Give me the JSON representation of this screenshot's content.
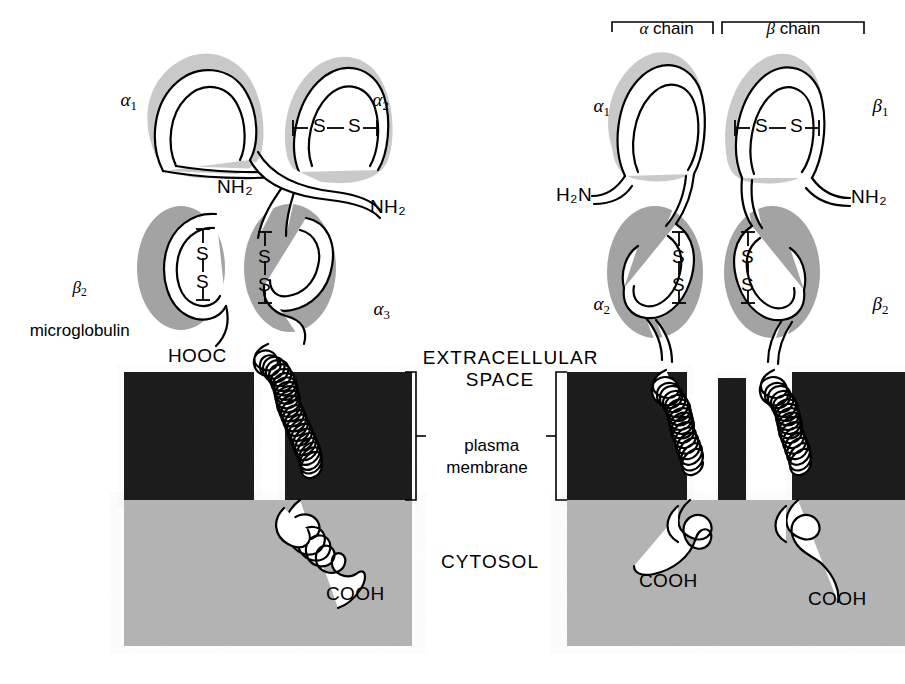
{
  "figure": {
    "colors": {
      "membrane_block": "#1a1a1a",
      "cytosol": "#b3b3b3",
      "domain_light": "#c9c9c9",
      "domain_dark": "#a3a3a3",
      "outline": "#000000",
      "background": "#ffffff"
    }
  },
  "zones": {
    "extracellular": "EXTRACELLULAR\nSPACE",
    "extracellular_line1": "EXTRACELLULAR",
    "extracellular_line2": "SPACE",
    "membrane_line1": "plasma",
    "membrane_line2": "membrane",
    "cytosol": "CYTOSOL"
  },
  "left_panel": {
    "name": "MHC class I molecule",
    "domains": [
      {
        "id": "alpha1",
        "label_greek": "α",
        "label_sub": "1"
      },
      {
        "id": "alpha2",
        "label_greek": "α",
        "label_sub": "2"
      },
      {
        "id": "alpha3",
        "label_greek": "α",
        "label_sub": "3"
      }
    ],
    "beta2m_line1_greek": "β",
    "beta2m_line1_sub": "2",
    "beta2m_line2": "microglobulin",
    "termini": [
      {
        "id": "nh2-left",
        "text": "NH₂"
      },
      {
        "id": "nh2-right",
        "text": "NH₂"
      },
      {
        "id": "hooc",
        "text": "HOOC"
      },
      {
        "id": "cooh",
        "text": "COOH"
      }
    ],
    "disulfides": [
      {
        "id": "ss-alpha2",
        "orientation": "horizontal",
        "text": "S—S"
      },
      {
        "id": "ss-b2m",
        "orientation": "vertical",
        "top": "S",
        "bottom": "S"
      },
      {
        "id": "ss-alpha3",
        "orientation": "vertical",
        "top": "S",
        "bottom": "S"
      }
    ]
  },
  "right_panel": {
    "name": "MHC class II molecule",
    "chain_brackets": [
      {
        "id": "alpha-chain",
        "greek": "α",
        "text": " chain"
      },
      {
        "id": "beta-chain",
        "greek": "β",
        "text": " chain"
      }
    ],
    "domains": [
      {
        "id": "alpha1",
        "label_greek": "α",
        "label_sub": "1"
      },
      {
        "id": "alpha2",
        "label_greek": "α",
        "label_sub": "2"
      },
      {
        "id": "beta1",
        "label_greek": "β",
        "label_sub": "1"
      },
      {
        "id": "beta2",
        "label_greek": "β",
        "label_sub": "2"
      }
    ],
    "termini": [
      {
        "id": "h2n",
        "text": "H₂N"
      },
      {
        "id": "nh2",
        "text": "NH₂"
      },
      {
        "id": "cooh-alpha",
        "text": "COOH"
      },
      {
        "id": "cooh-beta",
        "text": "COOH"
      }
    ],
    "disulfides": [
      {
        "id": "ss-beta1",
        "orientation": "horizontal",
        "text": "S—S"
      },
      {
        "id": "ss-alpha2",
        "orientation": "vertical",
        "top": "S",
        "bottom": "S"
      },
      {
        "id": "ss-beta2",
        "orientation": "vertical",
        "top": "S",
        "bottom": "S"
      }
    ]
  }
}
